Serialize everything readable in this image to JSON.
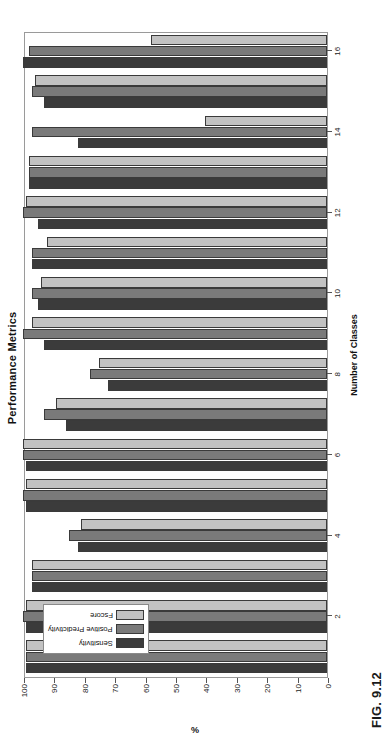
{
  "figure": {
    "caption": "FIG. 9.12"
  },
  "chart_data": {
    "type": "bar",
    "title": "Performance Metrics",
    "xlabel": "Number of Classes",
    "ylabel": "%",
    "ylim": [
      0,
      100
    ],
    "yticks": [
      0,
      10,
      20,
      30,
      40,
      50,
      60,
      70,
      80,
      90,
      100
    ],
    "ytick_labels": [
      "0",
      "10",
      "20",
      "30",
      "40",
      "50",
      "60",
      "70",
      "80",
      "90",
      "100"
    ],
    "grid": false,
    "orientation": "horizontal-bars-rotated-page",
    "legend_position": "upper-left",
    "categories": [
      1,
      2,
      3,
      4,
      5,
      6,
      7,
      8,
      9,
      10,
      11,
      12,
      13,
      14,
      15,
      16
    ],
    "xtick_labels": [
      "2",
      "4",
      "6",
      "8",
      "10",
      "12",
      "14",
      "16"
    ],
    "xtick_values": [
      2,
      4,
      6,
      8,
      10,
      12,
      14,
      16
    ],
    "series": [
      {
        "name": "Sensitivity",
        "color": "#3b3b3b",
        "values": [
          99,
          99,
          97,
          82,
          99,
          99,
          86,
          72,
          93,
          95,
          97,
          95,
          98,
          82,
          93,
          100
        ]
      },
      {
        "name": "Positive Predictivity",
        "color": "#7a7a7a",
        "values": [
          99,
          100,
          97,
          85,
          100,
          100,
          93,
          78,
          100,
          97,
          97,
          100,
          98,
          97,
          97,
          98
        ]
      },
      {
        "name": "Fscore",
        "color": "#c2c2c2",
        "values": [
          99,
          99,
          97,
          81,
          99,
          100,
          89,
          75,
          97,
          94,
          92,
          99,
          98,
          40,
          96,
          58
        ]
      }
    ]
  }
}
